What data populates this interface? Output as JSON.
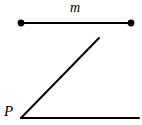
{
  "figure": {
    "background_color": "#ffffff",
    "stroke_color": "#000000",
    "width": 142,
    "height": 125
  },
  "labels": {
    "line_label": "m",
    "vertex_label": "P"
  },
  "diagram_data": {
    "type": "geometry",
    "elements": [
      {
        "kind": "segment",
        "name": "line-m",
        "label": "m",
        "endpoints": [
          [
            21,
            23
          ],
          [
            131,
            23
          ]
        ],
        "endpoint_markers": "filled-dots",
        "marker_radius": 3.4,
        "stroke_width": 2.0,
        "color": "#000000"
      },
      {
        "kind": "ray",
        "name": "angle-ray-slanted",
        "from": [
          21,
          118
        ],
        "to": [
          99,
          38
        ],
        "stroke_width": 2.0,
        "color": "#000000"
      },
      {
        "kind": "ray",
        "name": "angle-ray-horizontal",
        "from": [
          21,
          118
        ],
        "to": [
          139,
          118
        ],
        "stroke_width": 2.0,
        "color": "#000000"
      },
      {
        "kind": "vertex",
        "name": "vertex-P",
        "label": "P",
        "position": [
          21,
          118
        ]
      }
    ]
  }
}
